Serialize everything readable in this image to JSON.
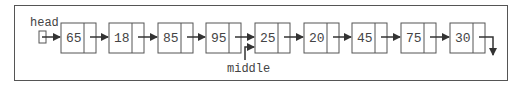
{
  "diagram": {
    "type": "singly-linked-list",
    "head_label": "head",
    "middle_label": "middle",
    "middle_points_to_index": 4,
    "nodes": [
      {
        "value": "65"
      },
      {
        "value": "18"
      },
      {
        "value": "85"
      },
      {
        "value": "95"
      },
      {
        "value": "25"
      },
      {
        "value": "20"
      },
      {
        "value": "45"
      },
      {
        "value": "75"
      },
      {
        "value": "30"
      }
    ],
    "colors": {
      "stroke": "#555555",
      "arrow": "#333333",
      "text": "#444444",
      "background": "#ffffff"
    }
  }
}
